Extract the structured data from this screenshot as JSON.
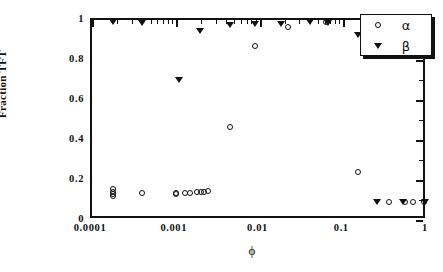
{
  "chart_data": {
    "type": "scatter",
    "title": "",
    "xlabel": "ϕ",
    "ylabel": "Fraction TFT",
    "xscale": "log",
    "yscale": "linear",
    "xlim": [
      0.0001,
      1
    ],
    "ylim": [
      0,
      1
    ],
    "grid": false,
    "legend_position": "top-right",
    "x_tick_labels": [
      "0.0001",
      "0.001",
      "0.01",
      "0.1",
      "1"
    ],
    "x_tick_values": [
      0.0001,
      0.001,
      0.01,
      0.1,
      1
    ],
    "y_tick_labels": [
      "0",
      "0.2",
      "0.4",
      "0.6",
      "0.8",
      "1"
    ],
    "y_tick_values": [
      0,
      0.2,
      0.4,
      0.6,
      0.8,
      1
    ],
    "series": [
      {
        "name": "α",
        "marker": "open-circle",
        "color": "#111111",
        "points": [
          [
            0.00018,
            0.155
          ],
          [
            0.00018,
            0.142
          ],
          [
            0.00018,
            0.128
          ],
          [
            0.00018,
            0.118
          ],
          [
            0.00039,
            0.137
          ],
          [
            0.001,
            0.137
          ],
          [
            0.001,
            0.128
          ],
          [
            0.0013,
            0.133
          ],
          [
            0.0015,
            0.133
          ],
          [
            0.0018,
            0.138
          ],
          [
            0.002,
            0.14
          ],
          [
            0.00215,
            0.138
          ],
          [
            0.0024,
            0.143
          ],
          [
            0.0045,
            0.464
          ],
          [
            0.0088,
            0.87
          ],
          [
            0.022,
            0.965
          ],
          [
            0.063,
            0.988
          ],
          [
            0.15,
            0.238
          ],
          [
            0.35,
            0.092
          ],
          [
            0.55,
            0.09
          ],
          [
            0.68,
            0.09
          ],
          [
            0.92,
            0.09
          ]
        ]
      },
      {
        "name": "β",
        "marker": "filled-triangle-down",
        "color": "#111111",
        "points": [
          [
            0.00018,
            0.992
          ],
          [
            0.00039,
            0.985
          ],
          [
            0.0011,
            0.7
          ],
          [
            0.00195,
            0.944
          ],
          [
            0.0045,
            0.975
          ],
          [
            0.0088,
            0.978
          ],
          [
            0.018,
            0.982
          ],
          [
            0.04,
            0.992
          ],
          [
            0.065,
            0.985
          ],
          [
            0.15,
            0.925
          ],
          [
            0.25,
            0.092
          ],
          [
            0.52,
            0.09
          ],
          [
            0.95,
            0.09
          ]
        ]
      }
    ]
  },
  "legend": {
    "entries": [
      {
        "symbol_name": "open-circle-marker",
        "label": "α"
      },
      {
        "symbol_name": "filled-triangle-marker",
        "label": "β"
      }
    ]
  }
}
